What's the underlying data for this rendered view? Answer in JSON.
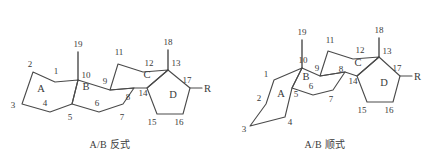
{
  "figure": {
    "background_color": "#ffffff",
    "line_color": "#4a4a4a",
    "text_color": "#3a3a3a"
  },
  "structures": [
    {
      "id": "trans",
      "caption": "A/B 反式",
      "ring_labels": [
        {
          "text": "A",
          "x": 41,
          "y": 92
        },
        {
          "text": "B",
          "x": 86,
          "y": 90
        },
        {
          "text": "C",
          "x": 147,
          "y": 78
        },
        {
          "text": "D",
          "x": 173,
          "y": 98
        }
      ],
      "atom_numbers": [
        {
          "text": "1",
          "x": 56,
          "y": 74
        },
        {
          "text": "2",
          "x": 28,
          "y": 69
        },
        {
          "text": "3",
          "x": 12,
          "y": 107
        },
        {
          "text": "4",
          "x": 45,
          "y": 105
        },
        {
          "text": "5",
          "x": 68,
          "y": 112
        },
        {
          "text": "6",
          "x": 96,
          "y": 105
        },
        {
          "text": "7",
          "x": 121,
          "y": 112
        },
        {
          "text": "8",
          "x": 125,
          "y": 93
        },
        {
          "text": "9",
          "x": 105,
          "y": 82
        },
        {
          "text": "10",
          "x": 80,
          "y": 72
        },
        {
          "text": "11",
          "x": 124,
          "y": 55
        },
        {
          "text": "12",
          "x": 151,
          "y": 63
        },
        {
          "text": "13",
          "x": 172,
          "y": 64
        },
        {
          "text": "14",
          "x": 140,
          "y": 92
        },
        {
          "text": "15",
          "x": 152,
          "y": 122
        },
        {
          "text": "16",
          "x": 176,
          "y": 122
        },
        {
          "text": "17",
          "x": 186,
          "y": 83
        },
        {
          "text": "18",
          "x": 166,
          "y": 43
        },
        {
          "text": "19",
          "x": 76,
          "y": 44
        }
      ],
      "substituent": {
        "text": "R",
        "x": 207,
        "y": 90
      }
    },
    {
      "id": "cis",
      "caption": "A/B 顺式",
      "ring_labels": [
        {
          "text": "A",
          "x": 281,
          "y": 97
        },
        {
          "text": "B",
          "x": 304,
          "y": 78
        },
        {
          "text": "C",
          "x": 357,
          "y": 66
        },
        {
          "text": "D",
          "x": 384,
          "y": 86
        },
        {
          "text": "D2",
          "x": 0,
          "y": 0
        }
      ],
      "atom_numbers": [
        {
          "text": "1",
          "x": 267,
          "y": 78
        },
        {
          "text": "2",
          "x": 261,
          "y": 97
        },
        {
          "text": "3",
          "x": 245,
          "y": 129
        },
        {
          "text": "4",
          "x": 288,
          "y": 122
        },
        {
          "text": "5",
          "x": 294,
          "y": 95
        },
        {
          "text": "6",
          "x": 310,
          "y": 90
        },
        {
          "text": "7",
          "x": 330,
          "y": 99
        },
        {
          "text": "8",
          "x": 342,
          "y": 78
        },
        {
          "text": "9",
          "x": 317,
          "y": 69
        },
        {
          "text": "10",
          "x": 303,
          "y": 60
        },
        {
          "text": "11",
          "x": 334,
          "y": 42
        },
        {
          "text": "12",
          "x": 362,
          "y": 50
        },
        {
          "text": "13",
          "x": 383,
          "y": 52
        },
        {
          "text": "14",
          "x": 350,
          "y": 80
        },
        {
          "text": "15",
          "x": 361,
          "y": 110
        },
        {
          "text": "16",
          "x": 386,
          "y": 110
        },
        {
          "text": "17",
          "x": 396,
          "y": 71
        },
        {
          "text": "18",
          "x": 377,
          "y": 31
        },
        {
          "text": "19",
          "x": 298,
          "y": 32
        }
      ],
      "substituent": {
        "text": "R",
        "x": 418,
        "y": 78
      }
    }
  ],
  "captions": [
    {
      "text": "A/B 反式",
      "x": 110,
      "y": 146
    },
    {
      "text": "A/B 顺式",
      "x": 325,
      "y": 146
    }
  ]
}
